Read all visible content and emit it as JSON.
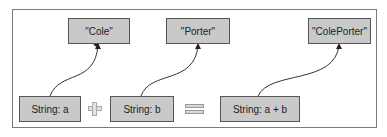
{
  "diagram": {
    "values": [
      {
        "label": "\"Cole\""
      },
      {
        "label": "\"Porter\""
      },
      {
        "label": "\"ColePorter\""
      }
    ],
    "variables": [
      {
        "label": "String: a"
      },
      {
        "label": "String: b"
      },
      {
        "label": "String: a + b"
      }
    ],
    "operators": [
      "plus",
      "equals"
    ],
    "colors": {
      "box_fill": "#c9c9c9",
      "box_border": "#555555",
      "frame_border": "#7a7a7a"
    }
  }
}
